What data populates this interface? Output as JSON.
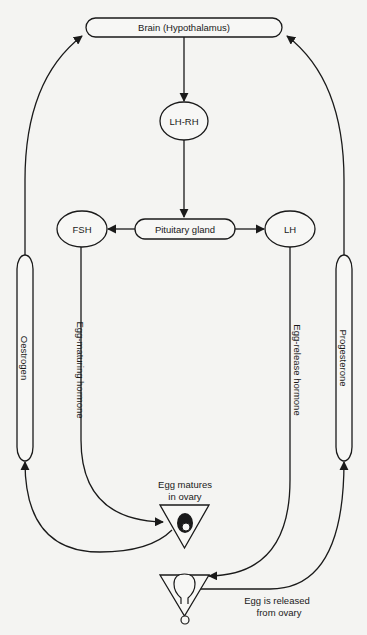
{
  "diagram": {
    "type": "hormone-feedback-flow",
    "nodes": {
      "brain": {
        "label": "Brain (Hypothalamus)"
      },
      "lhrh": {
        "label": "LH-RH"
      },
      "pituitary": {
        "label": "Pituitary gland"
      },
      "fsh": {
        "label": "FSH"
      },
      "lh": {
        "label": "LH"
      },
      "oestrogen": {
        "label": "Oestrogen"
      },
      "progesterone": {
        "label": "Progesterone"
      },
      "egg_matures": {
        "label_line1": "Egg matures",
        "label_line2": "in ovary"
      },
      "egg_released": {
        "label_line1": "Egg is released",
        "label_line2": "from ovary"
      }
    },
    "edge_labels": {
      "fsh_to_ovary": "Egg-maturing hormone",
      "lh_to_ovary": "Egg-release hormone"
    },
    "edges": [
      {
        "from": "Brain (Hypothalamus)",
        "to": "LH-RH"
      },
      {
        "from": "LH-RH",
        "to": "Pituitary gland"
      },
      {
        "from": "Pituitary gland",
        "to": "FSH"
      },
      {
        "from": "Pituitary gland",
        "to": "LH"
      },
      {
        "from": "FSH",
        "to": "Egg matures in ovary",
        "label": "Egg-maturing hormone"
      },
      {
        "from": "LH",
        "to": "Egg is released from ovary",
        "label": "Egg-release hormone"
      },
      {
        "from": "Egg matures in ovary",
        "to": "Oestrogen"
      },
      {
        "from": "Oestrogen",
        "to": "Brain (Hypothalamus)"
      },
      {
        "from": "Egg is released from ovary",
        "to": "Progesterone"
      },
      {
        "from": "Progesterone",
        "to": "Brain (Hypothalamus)"
      }
    ],
    "colors": {
      "line": "#1a1a1a",
      "background": "#f4f4f2"
    }
  }
}
